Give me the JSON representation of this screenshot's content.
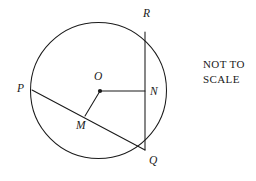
{
  "figure": {
    "kind": "circle-geometry-diagram",
    "background_color": "#ffffff",
    "stroke_color": "#1a1a1a",
    "width": 256,
    "height": 181
  },
  "note": {
    "line1": "NOT TO",
    "line2": "SCALE"
  },
  "circle": {
    "center_x": 98.5,
    "center_y": 90.5,
    "radius": 68
  },
  "points": [
    {
      "id": "R",
      "label": "R",
      "x": 145,
      "y": 32,
      "label_x": 143,
      "label_y": 8,
      "on_circle": true
    },
    {
      "id": "N",
      "label": "N",
      "x": 145,
      "y": 91,
      "label_x": 150,
      "label_y": 86,
      "on_circle": false
    },
    {
      "id": "Q",
      "label": "Q",
      "x": 145,
      "y": 150,
      "label_x": 149,
      "label_y": 155,
      "on_circle": true
    },
    {
      "id": "P",
      "label": "P",
      "x": 32,
      "y": 90,
      "label_x": 17,
      "label_y": 83,
      "on_circle": true
    },
    {
      "id": "O",
      "label": "O",
      "x": 100,
      "y": 91,
      "label_x": 94,
      "label_y": 71,
      "on_circle": false
    },
    {
      "id": "M",
      "label": "M",
      "x": 85,
      "y": 116,
      "label_x": 76,
      "label_y": 120,
      "on_circle": false
    }
  ],
  "segments": [
    {
      "id": "ON",
      "from": "O",
      "to": "N",
      "x1": 100,
      "y1": 91,
      "x2": 145,
      "y2": 91
    },
    {
      "id": "RQ",
      "from": "R",
      "to": "Q",
      "x1": 145,
      "y1": 32,
      "x2": 145,
      "y2": 150
    },
    {
      "id": "PQ",
      "from": "P",
      "to": "Q",
      "x1": 32,
      "y1": 90,
      "x2": 145,
      "y2": 150
    },
    {
      "id": "OM",
      "from": "O",
      "to": "M",
      "x1": 100,
      "y1": 91,
      "x2": 85,
      "y2": 116
    }
  ],
  "chart_data": {
    "type": "diagram",
    "title": "",
    "shapes": [
      {
        "shape": "circle",
        "center": [
          98.5,
          90.5
        ],
        "radius": 68
      },
      {
        "shape": "line",
        "name": "ON",
        "points": [
          [
            100,
            91
          ],
          [
            145,
            91
          ]
        ]
      },
      {
        "shape": "line",
        "name": "RQ (chord)",
        "points": [
          [
            145,
            32
          ],
          [
            145,
            150
          ]
        ]
      },
      {
        "shape": "line",
        "name": "PQ (chord)",
        "points": [
          [
            32,
            90
          ],
          [
            145,
            150
          ]
        ]
      },
      {
        "shape": "line",
        "name": "OM",
        "points": [
          [
            100,
            91
          ],
          [
            85,
            116
          ]
        ]
      },
      {
        "shape": "point",
        "name": "O (centre)",
        "points": [
          [
            100,
            91
          ]
        ]
      }
    ],
    "labels": [
      "R",
      "N",
      "Q",
      "P",
      "O",
      "M",
      "NOT TO SCALE"
    ]
  }
}
